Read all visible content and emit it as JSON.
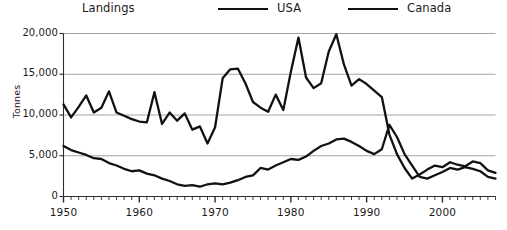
{
  "legend": {
    "title": "Landings",
    "entries": [
      {
        "label": "USA",
        "color": "#111111"
      },
      {
        "label": "Canada",
        "color": "#111111"
      }
    ]
  },
  "axes": {
    "y_title": "Tonnes",
    "y_ticks": [
      "0",
      "5,000",
      "10,000",
      "15,000",
      "20,000"
    ],
    "x_ticks": [
      "1950",
      "1960",
      "1970",
      "1980",
      "1990",
      "2000"
    ]
  },
  "chart_data": {
    "type": "line",
    "title": "Landings",
    "xlabel": "",
    "ylabel": "Tonnes",
    "xlim": [
      1950,
      2007
    ],
    "ylim": [
      0,
      20000
    ],
    "grid": true,
    "legend_position": "top",
    "x": [
      1950,
      1951,
      1952,
      1953,
      1954,
      1955,
      1956,
      1957,
      1958,
      1959,
      1960,
      1961,
      1962,
      1963,
      1964,
      1965,
      1966,
      1967,
      1968,
      1969,
      1970,
      1971,
      1972,
      1973,
      1974,
      1975,
      1976,
      1977,
      1978,
      1979,
      1980,
      1981,
      1982,
      1983,
      1984,
      1985,
      1986,
      1987,
      1988,
      1989,
      1990,
      1991,
      1992,
      1993,
      1994,
      1995,
      1996,
      1997,
      1998,
      1999,
      2000,
      2001,
      2002,
      2003,
      2004,
      2005,
      2006,
      2007
    ],
    "series": [
      {
        "name": "USA",
        "color": "#111111",
        "values": [
          11300,
          9700,
          11000,
          12400,
          10300,
          10900,
          12900,
          10300,
          9900,
          9500,
          9200,
          9100,
          12800,
          8900,
          10300,
          9300,
          10200,
          8200,
          8600,
          6500,
          8500,
          14500,
          15600,
          15700,
          13900,
          11600,
          10900,
          10400,
          12500,
          10600,
          15300,
          19500,
          14600,
          13300,
          13900,
          17800,
          19900,
          16200,
          13600,
          14400,
          13800,
          13000,
          12200,
          7600,
          5200,
          3500,
          2200,
          2700,
          3300,
          3800,
          3600,
          4200,
          3900,
          3700,
          4300,
          4100,
          3200,
          2900
        ]
      },
      {
        "name": "Canada",
        "color": "#111111",
        "values": [
          6200,
          5700,
          5400,
          5100,
          4700,
          4600,
          4100,
          3800,
          3400,
          3100,
          3200,
          2800,
          2600,
          2200,
          1900,
          1500,
          1300,
          1400,
          1200,
          1500,
          1600,
          1500,
          1700,
          2000,
          2400,
          2600,
          3500,
          3300,
          3800,
          4200,
          4600,
          4500,
          4900,
          5600,
          6200,
          6500,
          7000,
          7100,
          6700,
          6200,
          5600,
          5200,
          5800,
          8800,
          7300,
          5200,
          3800,
          2400,
          2200,
          2600,
          3000,
          3500,
          3300,
          3600,
          3400,
          3100,
          2400,
          2200
        ]
      }
    ]
  }
}
